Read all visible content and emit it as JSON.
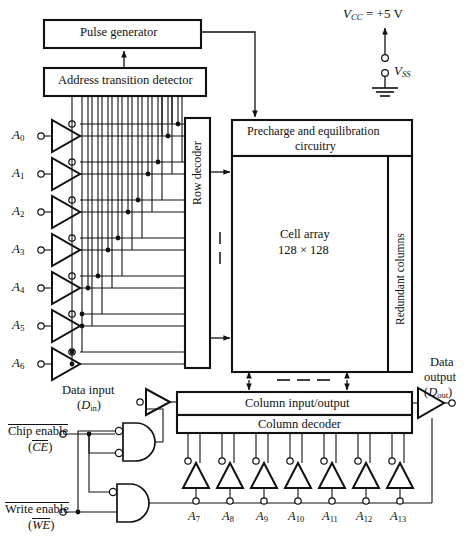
{
  "figure": {
    "type": "block-diagram",
    "line_color": "#111111",
    "background": "#ffffff"
  },
  "blocks": {
    "pulse_generator": "Pulse generator",
    "address_transition_detector": "Address transition detector",
    "row_decoder": "Row decoder",
    "precharge": "Precharge and equilibration circuitry",
    "precharge_line1": "Precharge and equilibration",
    "precharge_line2": "circuitry",
    "cell_array_line1": "Cell array",
    "cell_array_line2": "128 × 128",
    "redundant_columns": "Redundant columns",
    "column_io": "Column input/output",
    "column_decoder": "Column decoder"
  },
  "power": {
    "vcc": "V",
    "vcc_sub": "CC",
    "vcc_value": "= +5 V",
    "vss": "V",
    "vss_sub": "SS"
  },
  "row_address_pins": [
    {
      "name": "A",
      "sub": "0"
    },
    {
      "name": "A",
      "sub": "1"
    },
    {
      "name": "A",
      "sub": "2"
    },
    {
      "name": "A",
      "sub": "3"
    },
    {
      "name": "A",
      "sub": "4"
    },
    {
      "name": "A",
      "sub": "5"
    },
    {
      "name": "A",
      "sub": "6"
    }
  ],
  "column_address_pins": [
    {
      "name": "A",
      "sub": "7"
    },
    {
      "name": "A",
      "sub": "8"
    },
    {
      "name": "A",
      "sub": "9"
    },
    {
      "name": "A",
      "sub": "10"
    },
    {
      "name": "A",
      "sub": "11"
    },
    {
      "name": "A",
      "sub": "12"
    },
    {
      "name": "A",
      "sub": "13"
    }
  ],
  "io": {
    "data_input_label": "Data input",
    "data_input_symbol": "D",
    "data_input_sub": "in",
    "data_output_line1": "Data",
    "data_output_line2": "output",
    "data_output_symbol": "D",
    "data_output_sub": "out"
  },
  "controls": {
    "chip_enable_label": "Chip enable",
    "chip_enable_symbol": "CE",
    "write_enable_label": "Write enable",
    "write_enable_symbol": "WE"
  },
  "annotations": {
    "row_ellipsis": "– –",
    "col_ellipsis": "– – –"
  }
}
